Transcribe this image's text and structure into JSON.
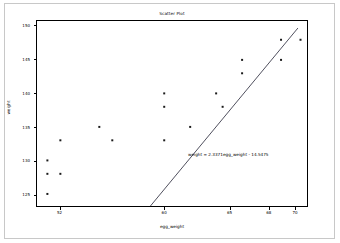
{
  "figure": {
    "background_color": "#ffffff",
    "frame_color": "#c8c8c8",
    "axes_color": "#000000"
  },
  "chart_data": {
    "type": "scatter",
    "title": "Scatter Plot",
    "xlabel": "egg_weight",
    "ylabel": "weight",
    "grid": false,
    "legend": null,
    "xlim": [
      50.2,
      71.0
    ],
    "ylim": [
      123.2,
      150.8
    ],
    "xticks": [
      52,
      60,
      65,
      68,
      70
    ],
    "xtick_labels": [
      "52",
      "60",
      "65",
      "68",
      "70"
    ],
    "yticks": [
      125,
      130,
      135,
      140,
      145,
      150
    ],
    "ytick_labels": [
      "125",
      "130",
      "135",
      "140",
      "145",
      "150"
    ],
    "marker_color": "#1a1a1a",
    "marker_size": 2.0,
    "points": [
      {
        "x": 51.0,
        "y": 125.0
      },
      {
        "x": 51.0,
        "y": 128.0
      },
      {
        "x": 51.0,
        "y": 130.0
      },
      {
        "x": 52.0,
        "y": 128.0
      },
      {
        "x": 52.0,
        "y": 133.0
      },
      {
        "x": 55.0,
        "y": 135.0
      },
      {
        "x": 56.0,
        "y": 133.0
      },
      {
        "x": 60.0,
        "y": 133.0
      },
      {
        "x": 60.0,
        "y": 138.0
      },
      {
        "x": 60.0,
        "y": 140.0
      },
      {
        "x": 62.0,
        "y": 135.0
      },
      {
        "x": 64.0,
        "y": 140.0
      },
      {
        "x": 64.5,
        "y": 138.0
      },
      {
        "x": 66.0,
        "y": 143.0
      },
      {
        "x": 66.0,
        "y": 145.0
      },
      {
        "x": 69.0,
        "y": 145.0
      },
      {
        "x": 69.0,
        "y": 148.0
      },
      {
        "x": 70.5,
        "y": 148.0
      }
    ],
    "fit_line": {
      "type": "linear-regression",
      "slope": 2.3371,
      "intercept": -14.5475,
      "color": "#3a3a4a",
      "x_start": 51.0,
      "x_end": 70.3
    },
    "annotation": {
      "text": "weight = 2.3371egg_weight - 14.5475",
      "x": 62.0,
      "y": 136.0
    }
  }
}
